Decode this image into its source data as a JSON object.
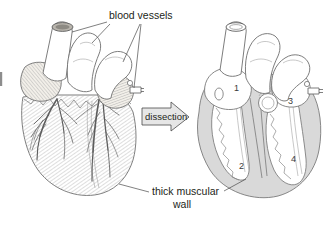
{
  "figure": {
    "kind": "biology-diagram",
    "background_color": "#ffffff",
    "ink_color": "#231f20",
    "outline_color": "#6e6e6e",
    "muscle_fill_color": "#d9d9d9",
    "hatch_color": "#b4b4b4",
    "vessel_fill_color": "#ffffff"
  },
  "labels": {
    "blood_vessels": "blood vessels",
    "thick_muscular_wall_line1": "thick muscular",
    "thick_muscular_wall_line2": "wall",
    "dissection": "dissection"
  },
  "left_heart": {
    "name": "intact heart external view",
    "features": [
      "great vessels at top",
      "left and right atrial appendages with hatching",
      "coronary arteries branching over ventricles",
      "hatched muscular ventricle surface"
    ]
  },
  "right_heart": {
    "name": "dissected heart showing chambers",
    "chamber_numbers": [
      {
        "id": "1",
        "text": "1",
        "x": 236,
        "y": 88
      },
      {
        "id": "2",
        "text": "2",
        "x": 241,
        "y": 166
      },
      {
        "id": "3",
        "text": "3",
        "x": 290,
        "y": 101
      },
      {
        "id": "4",
        "text": "4",
        "x": 293,
        "y": 159
      }
    ]
  },
  "arrow": {
    "label": "dissection",
    "direction": "right",
    "fill": "#e6e6e6",
    "stroke": "#4a4a4a"
  }
}
